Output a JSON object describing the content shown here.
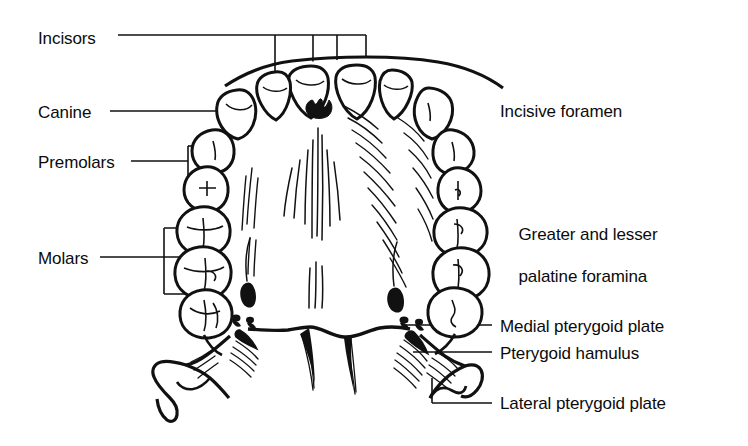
{
  "figure": {
    "background_color": "#ffffff",
    "ink_color": "#0b0b0b",
    "width": 748,
    "height": 446
  },
  "labels": [
    {
      "id": "incisors",
      "text": "Incisors",
      "side": "left",
      "x": 38,
      "y": 28,
      "leader": "horizontal line to bracket with four drop lines pointing to the four incisor teeth"
    },
    {
      "id": "canine",
      "text": "Canine",
      "side": "left",
      "x": 38,
      "y": 102,
      "leader": "horizontal line to the canine tooth"
    },
    {
      "id": "premolars",
      "text": "Premolars",
      "side": "left",
      "x": 38,
      "y": 152,
      "leader": "horizontal line to a square bracket with two ticks to the two premolars"
    },
    {
      "id": "molars",
      "text": "Molars",
      "side": "left",
      "x": 38,
      "y": 248,
      "leader": "horizontal line to a square bracket with three ticks to the three molars"
    },
    {
      "id": "incisive-foramen",
      "text": "Incisive foramen",
      "side": "right",
      "x": 500,
      "y": 101,
      "leader": "horizontal line to the incisive foramen in the anterior midline of the palate"
    },
    {
      "id": "palatine-foramina",
      "text": "Greater and lesser\npalatine foramina",
      "line1": "Greater and lesser",
      "line2": "palatine foramina",
      "side": "right",
      "x": 500,
      "y": 203,
      "leader": "bracket with two lines to the greater palatine foramen and lesser palatine foramina"
    },
    {
      "id": "medial-pterygoid-plate",
      "text": "Medial pterygoid plate",
      "side": "right",
      "x": 500,
      "y": 316,
      "leader": "horizontal line to the medial pterygoid plate"
    },
    {
      "id": "pterygoid-hamulus",
      "text": "Pterygoid hamulus",
      "side": "right",
      "x": 500,
      "y": 343,
      "leader": "horizontal line to the pterygoid hamulus"
    },
    {
      "id": "lateral-pterygoid-plate",
      "text": "Lateral pterygoid plate",
      "side": "right",
      "x": 500,
      "y": 393,
      "leader": "elbow line from the lateral pterygoid plate"
    }
  ],
  "structures": [
    {
      "id": "dental-arch",
      "name": "upper dental arch"
    },
    {
      "id": "incisor-teeth",
      "name": "incisor teeth",
      "count": 4
    },
    {
      "id": "canine-teeth",
      "name": "canine teeth",
      "count": 2
    },
    {
      "id": "premolar-teeth",
      "name": "premolar teeth",
      "count": 4
    },
    {
      "id": "molar-teeth",
      "name": "molar teeth",
      "count": 6
    },
    {
      "id": "incisive-foramen-mark",
      "name": "incisive foramen"
    },
    {
      "id": "greater-palatine-foramen-left",
      "name": "greater palatine foramen (left)"
    },
    {
      "id": "greater-palatine-foramen-right",
      "name": "greater palatine foramen (right)"
    },
    {
      "id": "lesser-palatine-foramina-left",
      "name": "lesser palatine foramina (left)"
    },
    {
      "id": "lesser-palatine-foramina-right",
      "name": "lesser palatine foramina (right)"
    },
    {
      "id": "palatine-raphe",
      "name": "median palatine raphe and suture lines"
    },
    {
      "id": "medial-pterygoid-plate-left",
      "name": "medial pterygoid plate (left)"
    },
    {
      "id": "medial-pterygoid-plate-right",
      "name": "medial pterygoid plate (right)"
    },
    {
      "id": "pterygoid-hamulus-left",
      "name": "pterygoid hamulus (left)"
    },
    {
      "id": "pterygoid-hamulus-right",
      "name": "pterygoid hamulus (right)"
    },
    {
      "id": "lateral-pterygoid-plate-left",
      "name": "lateral pterygoid plate (left)"
    },
    {
      "id": "lateral-pterygoid-plate-right",
      "name": "lateral pterygoid plate (right)"
    },
    {
      "id": "posterior-nasal-spine",
      "name": "posterior border of hard palate"
    }
  ]
}
